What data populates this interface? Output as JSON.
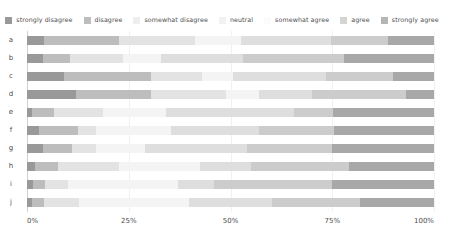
{
  "chart_data": {
    "type": "bar",
    "subtype": "stacked-horizontal-likert",
    "title": "",
    "subtitle": "",
    "xlabel": "",
    "ylabel": "",
    "orientation": "horizontal",
    "stacked": true,
    "normalized": true,
    "grid": true,
    "legend_position": "top",
    "xlim": [
      0,
      100
    ],
    "xticks": [
      "0%",
      "25%",
      "50%",
      "75%",
      "100%"
    ],
    "xtick_values": [
      0,
      25,
      50,
      75,
      100
    ],
    "categories": [
      "a",
      "b",
      "c",
      "d",
      "e",
      "f",
      "g",
      "h",
      "i",
      "j"
    ],
    "series": [
      {
        "name": "strongly disagree",
        "color": "#999999",
        "values": [
          4.2,
          4.0,
          9.0,
          12.0,
          1.2,
          3.0,
          4.0,
          2.0,
          1.5,
          1.2
        ]
      },
      {
        "name": "disagree",
        "color": "#bdbdbd",
        "values": [
          18.5,
          6.5,
          21.5,
          18.5,
          5.5,
          9.5,
          7.0,
          5.5,
          3.0,
          3.0
        ]
      },
      {
        "name": "somewhat disagree",
        "color": "#e3e3e3",
        "values": [
          18.5,
          13.0,
          12.5,
          18.5,
          12.0,
          4.5,
          6.0,
          15.0,
          5.5,
          8.5
        ]
      },
      {
        "name": "neutral",
        "color": "#f4f4f4",
        "values": [
          11.5,
          9.5,
          7.5,
          8.0,
          15.5,
          18.5,
          12.0,
          20.0,
          27.0,
          27.0
        ]
      },
      {
        "name": "somewhat agree",
        "color": "#dedede",
        "values": [
          22.0,
          20.0,
          23.0,
          13.0,
          31.5,
          21.5,
          25.0,
          12.5,
          9.0,
          20.5
        ]
      },
      {
        "name": "agree",
        "color": "#cccccc",
        "values": [
          14.0,
          25.0,
          16.5,
          23.0,
          9.5,
          18.5,
          21.0,
          24.0,
          29.0,
          21.5
        ]
      },
      {
        "name": "strongly agree",
        "color": "#a8a8a8",
        "values": [
          11.3,
          22.0,
          10.0,
          7.0,
          24.8,
          24.5,
          25.0,
          21.0,
          25.0,
          18.3
        ]
      }
    ]
  },
  "legend": {
    "items": [
      {
        "label": "strongly disagree",
        "color": "#999999"
      },
      {
        "label": "disagree",
        "color": "#bdbdbd"
      },
      {
        "label": "somewhat disagree",
        "color": "#eeeeee"
      },
      {
        "label": "neutral",
        "color": "#f2f2f2"
      },
      {
        "label": "somewhat agree",
        "color": "#fbfbfb"
      },
      {
        "label": "agree",
        "color": "#d4d4d4"
      },
      {
        "label": "strongly agree",
        "color": "#b5b5b5"
      }
    ]
  },
  "axis": {
    "x_ticks": [
      "0%",
      "25%",
      "50%",
      "75%",
      "100%"
    ],
    "y_labels": [
      "a",
      "b",
      "c",
      "d",
      "e",
      "f",
      "g",
      "h",
      "i",
      "j"
    ]
  },
  "colors": {
    "background": "#ffffff",
    "text": "#4d4d4d",
    "gridline": "#f0f0f0",
    "axis": "#cfcfcf"
  }
}
